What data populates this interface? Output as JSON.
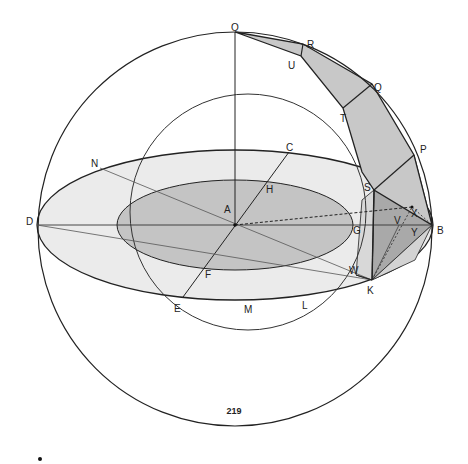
{
  "figure": {
    "labels": {
      "O": "O",
      "R": "R",
      "U": "U",
      "Q": "Q",
      "T": "T",
      "P": "P",
      "S": "S",
      "N": "N",
      "C": "C",
      "H": "H",
      "D": "D",
      "A": "A",
      "G": "G",
      "B": "B",
      "V": "V",
      "X": "X",
      "Y": "Y",
      "W": "W",
      "K": "K",
      "F": "F",
      "E": "E",
      "M": "M",
      "L": "L"
    },
    "colors": {
      "outer_ellipse_fill": "#ebebeb",
      "inner_ellipse_fill": "#c4c4c4",
      "strip_fill": "#c8c8c8",
      "pyramid_dark": "#a9a9a9",
      "pyramid_light": "#d3d3d3",
      "stroke": "#222222"
    }
  },
  "page_number": "219"
}
